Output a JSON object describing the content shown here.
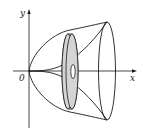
{
  "diagram": {
    "type": "solid-of-revolution-washer",
    "labels": {
      "y_axis": "y",
      "x_axis": "x",
      "origin": "0"
    },
    "colors": {
      "stroke": "#1a1a1a",
      "washer_fill": "#d4d4d4",
      "background": "#ffffff"
    }
  }
}
